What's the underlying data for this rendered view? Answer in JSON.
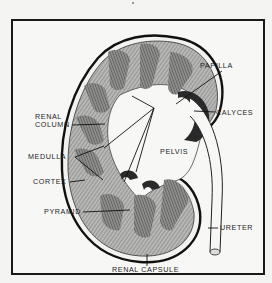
{
  "diagram": {
    "labels": {
      "papilla": "PAPILLA",
      "renal_column_line1": "RENAL",
      "renal_column_line2": "COLUMN",
      "calyces": "CALYCES",
      "medulla": "MEDULLA",
      "pelvis": "PELVIS",
      "cortex": "CORTEX",
      "pyramid": "PYRAMID",
      "ureter": "URETER",
      "renal_capsule": "RENAL CAPSULE"
    },
    "colors": {
      "ink": "#1a1a1a",
      "tissue": "#9a9a9a",
      "background": "#f7f7f5"
    }
  }
}
